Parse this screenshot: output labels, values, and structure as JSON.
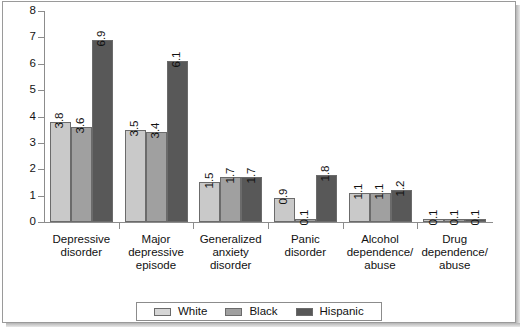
{
  "chart_data": {
    "type": "bar",
    "title": "",
    "xlabel": "",
    "ylabel": "",
    "ylim": [
      0,
      8
    ],
    "yticks": [
      0,
      1,
      2,
      3,
      4,
      5,
      6,
      7,
      8
    ],
    "grid": false,
    "legend_position": "bottom",
    "categories": [
      "Depressive\ndisorder",
      "Major\ndepressive\nepisode",
      "Generalized\nanxiety\ndisorder",
      "Panic\ndisorder",
      "Alcohol\ndependence/\nabuse",
      "Drug\ndependence/\nabuse"
    ],
    "series": [
      {
        "name": "White",
        "color": "#c9c9c9",
        "values": [
          3.8,
          3.5,
          1.5,
          0.9,
          1.1,
          0.1
        ]
      },
      {
        "name": "Black",
        "color": "#a0a0a0",
        "values": [
          3.6,
          3.4,
          1.7,
          0.1,
          1.1,
          0.1
        ]
      },
      {
        "name": "Hispanic",
        "color": "#585858",
        "values": [
          6.9,
          6.1,
          1.7,
          1.8,
          1.2,
          0.1
        ]
      }
    ],
    "value_labels": [
      [
        "3.8",
        "3.6",
        "6.9"
      ],
      [
        "3.5",
        "3.4",
        "6.1"
      ],
      [
        "1.5",
        "1.7",
        "1.7"
      ],
      [
        "0.9",
        "0.1",
        "1.8"
      ],
      [
        "1.1",
        "1.1",
        "1.2"
      ],
      [
        "0.1",
        "0.1",
        "0.1"
      ]
    ]
  },
  "legend": {
    "items": [
      {
        "label": "White"
      },
      {
        "label": "Black"
      },
      {
        "label": "Hispanic"
      }
    ]
  }
}
